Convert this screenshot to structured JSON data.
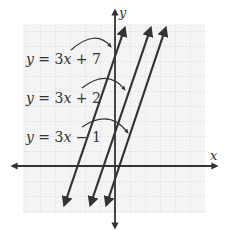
{
  "axes": {
    "x_label": "x",
    "y_label": "y"
  },
  "lines": [
    {
      "id": "line-1",
      "equation": "y = 3x + 7",
      "eq_var": "y",
      "eq_rest": " = 3",
      "eq_x": "x",
      "eq_tail": " + 7",
      "slope": 3,
      "intercept": 7
    },
    {
      "id": "line-2",
      "equation": "y = 3x + 2",
      "eq_var": "y",
      "eq_rest": " = 3",
      "eq_x": "x",
      "eq_tail": " + 2",
      "slope": 3,
      "intercept": 2
    },
    {
      "id": "line-3",
      "equation": "y = 3x − 1",
      "eq_var": "y",
      "eq_rest": " = 3",
      "eq_x": "x",
      "eq_tail": " − 1",
      "slope": 3,
      "intercept": -1
    }
  ],
  "colors": {
    "line": "#333333",
    "grid": "#c8c8c8",
    "grid_bg": "#f4f4f4",
    "axis": "#333333"
  }
}
